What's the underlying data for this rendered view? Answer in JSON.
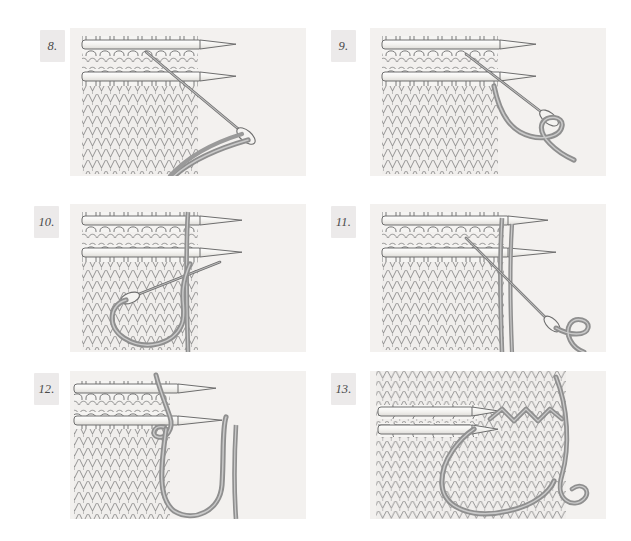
{
  "document": {
    "kind": "knitting-instruction-diagram",
    "technique": "grafting live stitches (Kitchener stitch) with tapestry needle",
    "background_color": "#ffffff",
    "panel_background_color": "#f3f1ef",
    "yarn_color": "#8f8f8f",
    "needle_color": "#f6f5f2",
    "outline_color": "#6b6b6b",
    "columns": 2,
    "rows": 3
  },
  "panels": [
    {
      "id": "step-8",
      "number": "8.",
      "caption": "Working yarn drawn down and around below the two needles holding live stitches.",
      "needles": 2,
      "loops_per_needle": 8,
      "tapestry_needle": true,
      "yarn_path": "diagonal-down-right-with-loop"
    },
    {
      "id": "step-9",
      "number": "9.",
      "caption": "Tapestry needle passes through the first stitch on the front needle; yarn trails to the lower right.",
      "needles": 2,
      "loops_per_needle": 8,
      "tapestry_needle": true,
      "yarn_path": "down-right-open-curve"
    },
    {
      "id": "step-10",
      "number": "10.",
      "caption": "Yarn pulled through and looped back across the fabric face toward the left.",
      "needles": 2,
      "loops_per_needle": 8,
      "tapestry_needle": true,
      "yarn_path": "large-left-hook-loop"
    },
    {
      "id": "step-11",
      "number": "11.",
      "caption": "Tapestry needle inserted through the front stitch and a loop forms at the lower right.",
      "needles": 2,
      "loops_per_needle": 8,
      "tapestry_needle": true,
      "yarn_path": "right-hook-loop"
    },
    {
      "id": "step-12",
      "number": "12.",
      "caption": "Stitch dropped from the needle; yarn swings down forming a long U under the fabric edge.",
      "needles": 2,
      "loops_per_needle": 8,
      "tapestry_needle": true,
      "yarn_path": "long-u-drop"
    },
    {
      "id": "step-13",
      "number": "13.",
      "caption": "Completed graft: the joining row of zig-zag stitches matches the surrounding stockinette.",
      "needles": 2,
      "loops_per_needle": 7,
      "tapestry_needle": true,
      "yarn_path": "grafted-zigzag-row",
      "orientation": "rotated-side-view"
    }
  ]
}
